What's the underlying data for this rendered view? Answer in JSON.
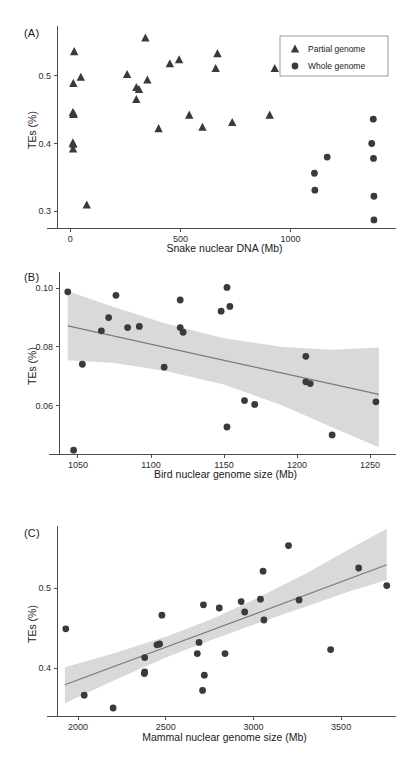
{
  "figure": {
    "panels": [
      {
        "label": "(A)",
        "xlabel": "Snake nuclear DNA (Mb)",
        "ylabel": "TEs (%)"
      },
      {
        "label": "(B)",
        "xlabel": "Bird nuclear genome size (Mb)",
        "ylabel": "TEs (%)"
      },
      {
        "label": "(C)",
        "xlabel": "Mammal nuclear genome size (Mb)",
        "ylabel": "TEs (%)"
      }
    ],
    "colors": {
      "point": "#3a3a3a",
      "regression_line": "#7a7a7a",
      "confidence_band": "#d9d9d9",
      "axis": "#4d4d4d",
      "text": "#1a1a1a"
    }
  },
  "chart_data": [
    {
      "type": "scatter",
      "panel": "(A)",
      "title": "",
      "xlabel": "Snake nuclear DNA (Mb)",
      "ylabel": "TEs (%)",
      "xlim": [
        -60,
        1460
      ],
      "ylim": [
        0.275,
        0.565
      ],
      "xticks": [
        0,
        500,
        1000
      ],
      "xtick_labels": [
        "0",
        "500",
        "1000"
      ],
      "yticks": [
        0.3,
        0.4,
        0.5
      ],
      "ytick_labels": [
        "0.3",
        "0.4",
        "0.5"
      ],
      "grid": false,
      "legend": {
        "position": "top-right",
        "entries": [
          {
            "label": "Partial genome",
            "marker": "triangle"
          },
          {
            "label": "Whole genome",
            "marker": "circle"
          }
        ]
      },
      "series": [
        {
          "name": "Partial genome",
          "marker": "triangle",
          "points": [
            [
              18,
              0.536
            ],
            [
              14,
              0.489
            ],
            [
              48,
              0.498
            ],
            [
              12,
              0.446
            ],
            [
              16,
              0.444
            ],
            [
              14,
              0.443
            ],
            [
              12,
              0.401
            ],
            [
              14,
              0.399
            ],
            [
              13,
              0.392
            ],
            [
              75,
              0.309
            ],
            [
              258,
              0.502
            ],
            [
              300,
              0.483
            ],
            [
              312,
              0.48
            ],
            [
              300,
              0.465
            ],
            [
              341,
              0.556
            ],
            [
              350,
              0.494
            ],
            [
              401,
              0.422
            ],
            [
              452,
              0.518
            ],
            [
              494,
              0.524
            ],
            [
              540,
              0.442
            ],
            [
              600,
              0.424
            ],
            [
              660,
              0.511
            ],
            [
              668,
              0.533
            ],
            [
              735,
              0.431
            ],
            [
              905,
              0.442
            ],
            [
              928,
              0.511
            ]
          ]
        },
        {
          "name": "Whole genome",
          "marker": "circle",
          "points": [
            [
              1108,
              0.356
            ],
            [
              1110,
              0.331
            ],
            [
              1166,
              0.38
            ],
            [
              1375,
              0.436
            ],
            [
              1368,
              0.4
            ],
            [
              1376,
              0.378
            ],
            [
              1378,
              0.322
            ],
            [
              1378,
              0.287
            ]
          ]
        }
      ]
    },
    {
      "type": "scatter",
      "panel": "(B)",
      "title": "",
      "xlabel": "Bird nuclear genome size (Mb)",
      "ylabel": "TEs (%)",
      "xlim": [
        1037,
        1265
      ],
      "ylim": [
        0.0435,
        0.1035
      ],
      "xticks": [
        1050,
        1100,
        1150,
        1200,
        1250
      ],
      "xtick_labels": [
        "1050",
        "1100",
        "1150",
        "1200",
        "1250"
      ],
      "yticks": [
        0.06,
        0.08,
        0.1
      ],
      "ytick_labels": [
        "0.06",
        "0.08",
        "0.10"
      ],
      "grid": false,
      "has_regression": true,
      "regression": {
        "type": "linear",
        "x": [
          1043,
          1256
        ],
        "y": [
          0.0872,
          0.0638
        ],
        "confidence_band": {
          "x": [
            1043,
            1075,
            1110,
            1150,
            1190,
            1225,
            1256
          ],
          "upper": [
            0.099,
            0.0935,
            0.088,
            0.083,
            0.08,
            0.079,
            0.0798
          ],
          "lower": [
            0.0755,
            0.0745,
            0.0718,
            0.0672,
            0.06,
            0.0524,
            0.0458
          ]
        }
      },
      "series": [
        {
          "name": "Bird species",
          "marker": "circle",
          "points": [
            [
              1043,
              0.0988
            ],
            [
              1053,
              0.0741
            ],
            [
              1047,
              0.0448
            ],
            [
              1066,
              0.0855
            ],
            [
              1071,
              0.09
            ],
            [
              1076,
              0.0976
            ],
            [
              1084,
              0.0866
            ],
            [
              1092,
              0.087
            ],
            [
              1109,
              0.0731
            ],
            [
              1120,
              0.096
            ],
            [
              1120,
              0.0866
            ],
            [
              1122,
              0.085
            ],
            [
              1148,
              0.0922
            ],
            [
              1152,
              0.1003
            ],
            [
              1154,
              0.0938
            ],
            [
              1152,
              0.0527
            ],
            [
              1164,
              0.0617
            ],
            [
              1171,
              0.0604
            ],
            [
              1206,
              0.0768
            ],
            [
              1206,
              0.0681
            ],
            [
              1209,
              0.0675
            ],
            [
              1224,
              0.05
            ],
            [
              1254,
              0.0613
            ]
          ]
        }
      ]
    },
    {
      "type": "scatter",
      "panel": "(C)",
      "title": "",
      "xlabel": "Mammal nuclear genome size (Mb)",
      "ylabel": "TEs (%)",
      "xlim": [
        1880,
        3790
      ],
      "ylim": [
        0.34,
        0.57
      ],
      "xticks": [
        2000,
        2500,
        3000,
        3500
      ],
      "xtick_labels": [
        "2000",
        "2500",
        "3000",
        "3500"
      ],
      "yticks": [
        0.4,
        0.5
      ],
      "ytick_labels": [
        "0.4",
        "0.5"
      ],
      "grid": false,
      "has_regression": true,
      "regression": {
        "type": "linear",
        "x": [
          1925,
          3760
        ],
        "y": [
          0.379,
          0.529
        ],
        "confidence_band": {
          "x": [
            1925,
            2200,
            2500,
            2750,
            3000,
            3300,
            3550,
            3760
          ],
          "upper": [
            0.401,
            0.418,
            0.439,
            0.46,
            0.485,
            0.518,
            0.549,
            0.574
          ],
          "lower": [
            0.356,
            0.384,
            0.413,
            0.434,
            0.454,
            0.477,
            0.496,
            0.51
          ]
        }
      },
      "series": [
        {
          "name": "Mammal species",
          "marker": "circle",
          "points": [
            [
              1930,
              0.449
            ],
            [
              2035,
              0.366
            ],
            [
              2200,
              0.35
            ],
            [
              2380,
              0.395
            ],
            [
              2378,
              0.393
            ],
            [
              2380,
              0.413
            ],
            [
              2450,
              0.429
            ],
            [
              2465,
              0.43
            ],
            [
              2478,
              0.466
            ],
            [
              2690,
              0.432
            ],
            [
              2680,
              0.418
            ],
            [
              2715,
              0.479
            ],
            [
              2720,
              0.391
            ],
            [
              2710,
              0.372
            ],
            [
              2805,
              0.475
            ],
            [
              2838,
              0.418
            ],
            [
              2930,
              0.483
            ],
            [
              2950,
              0.47
            ],
            [
              3040,
              0.486
            ],
            [
              3060,
              0.46
            ],
            [
              3055,
              0.521
            ],
            [
              3200,
              0.553
            ],
            [
              3260,
              0.485
            ],
            [
              3440,
              0.423
            ],
            [
              3600,
              0.525
            ],
            [
              3760,
              0.503
            ]
          ]
        }
      ]
    }
  ]
}
